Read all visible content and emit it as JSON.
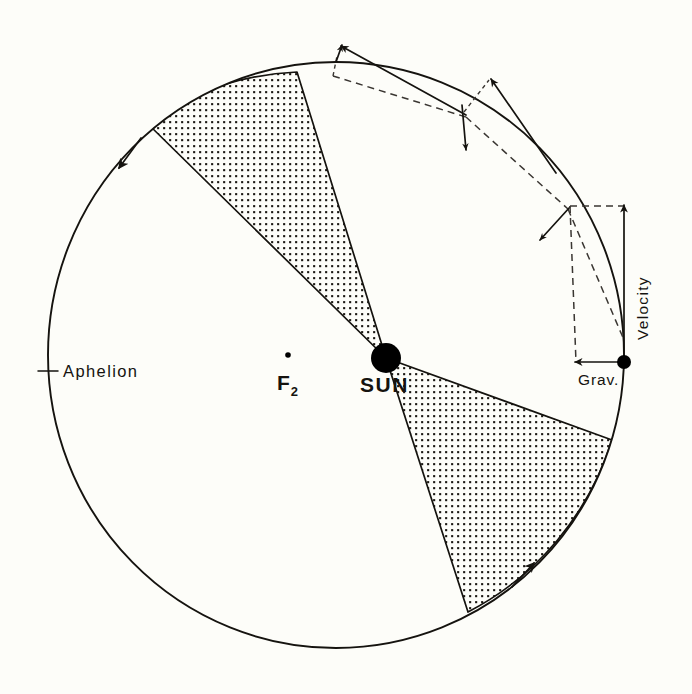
{
  "figure": {
    "background_color": "#fdfdf9",
    "ink_color": "#15130f",
    "stipple_color": "#1a1712"
  },
  "labels": {
    "aphelion": "Aphelion",
    "sun": "SUN",
    "focus2_main": "F",
    "focus2_sub": "2",
    "velocity": "Velocity",
    "gravity": "Grav."
  },
  "orbit": {
    "shape": "ellipse",
    "center_x": 336,
    "center_y": 355,
    "radius_x": 288,
    "radius_y": 293,
    "direction": "counterclockwise",
    "arrow_count": 2
  },
  "sun": {
    "x": 386,
    "y": 358,
    "radius": 15,
    "filled": true
  },
  "focus2": {
    "dot_x": 288,
    "dot_y": 355,
    "dot_radius": 2.6,
    "label_x": 279,
    "label_y": 388
  },
  "aphelion_tick": {
    "x1": 38,
    "y1": 371,
    "x2": 57,
    "y2": 371,
    "label_x": 62,
    "label_y": 377
  },
  "swept_sectors": [
    {
      "name": "upper-left-sector",
      "edge_a_x": 297,
      "edge_a_y": 72,
      "edge_b_x": 147,
      "edge_b_y": 123,
      "shaded": true
    },
    {
      "name": "lower-right-sector",
      "edge_a_x": 612,
      "edge_a_y": 440,
      "edge_b_x": 468,
      "edge_b_y": 612,
      "shaded": true
    }
  ],
  "vector_stations": [
    {
      "name": "station-1",
      "orbit_x": 333,
      "orbit_y": 75,
      "velocity_tip_x": 462,
      "velocity_tip_y": 108,
      "gravity_tip_x": 342,
      "gravity_tip_y": 44,
      "resultant_tip_x": 462,
      "resultant_tip_y": 108
    },
    {
      "name": "station-2",
      "orbit_x": 464,
      "orbit_y": 113,
      "velocity_tip_x": 554,
      "velocity_tip_y": 170,
      "gravity_tip_x": 468,
      "gravity_tip_y": 148,
      "resultant_tip_x": 554,
      "resultant_tip_y": 170
    },
    {
      "name": "station-3",
      "orbit_x": 568,
      "orbit_y": 208,
      "velocity_tip_x": 624,
      "velocity_tip_y": 340,
      "gravity_tip_x": 540,
      "gravity_tip_y": 238,
      "resultant_tip_x": 624,
      "resultant_tip_y": 340
    }
  ],
  "planet": {
    "x": 624,
    "y": 362,
    "radius": 7,
    "filled": true
  },
  "resolved_vectors": {
    "velocity_arrow": {
      "from_x": 624,
      "from_y": 362,
      "to_x": 624,
      "to_y": 206,
      "direction": "up",
      "label": "Velocity"
    },
    "gravity_arrow": {
      "from_x": 624,
      "from_y": 362,
      "to_x": 576,
      "to_y": 362,
      "direction": "left",
      "label": "Grav."
    },
    "dashed_rectangle": {
      "corner_top_left_x": 576,
      "corner_top_left_y": 206,
      "corner_bottom_right_x": 624,
      "corner_bottom_right_y": 362
    }
  },
  "colors": {
    "ink": "#15130f",
    "paper": "#fdfdf9",
    "dashed": "#3a3632"
  }
}
